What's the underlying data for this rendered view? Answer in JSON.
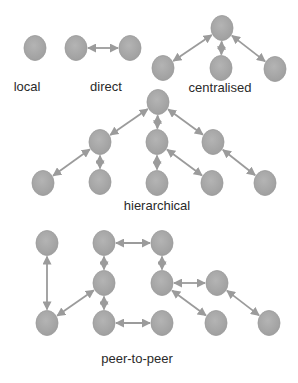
{
  "colors": {
    "node_fill": "#a8a8a8",
    "node_fill_light": "#bdbdbd",
    "node_stroke": "#9a9a9a",
    "edge": "#9b9b9b",
    "label": "#2a2a2a",
    "background": "#ffffff"
  },
  "node_radius": {
    "rx": 11,
    "ry": 12.5
  },
  "groups": [
    {
      "id": "local",
      "label": "local",
      "label_pos": [
        27,
        86
      ],
      "nodes": [
        {
          "id": "l1",
          "x": 35,
          "y": 48
        }
      ],
      "edges": []
    },
    {
      "id": "direct",
      "label": "direct",
      "label_pos": [
        106,
        86
      ],
      "nodes": [
        {
          "id": "d1",
          "x": 76,
          "y": 48
        },
        {
          "id": "d2",
          "x": 130,
          "y": 48
        }
      ],
      "edges": [
        [
          "d1",
          "d2"
        ]
      ]
    },
    {
      "id": "centralised",
      "label": "centralised",
      "label_pos": [
        220,
        87
      ],
      "nodes": [
        {
          "id": "c0",
          "x": 222,
          "y": 28
        },
        {
          "id": "c1",
          "x": 163,
          "y": 68
        },
        {
          "id": "c2",
          "x": 221,
          "y": 68
        },
        {
          "id": "c3",
          "x": 275,
          "y": 69
        }
      ],
      "edges": [
        [
          "c0",
          "c1"
        ],
        [
          "c0",
          "c2"
        ],
        [
          "c0",
          "c3"
        ]
      ]
    },
    {
      "id": "hierarchical",
      "label": "hierarchical",
      "label_pos": [
        157,
        205
      ],
      "nodes": [
        {
          "id": "h0",
          "x": 158,
          "y": 102
        },
        {
          "id": "h1",
          "x": 100,
          "y": 142
        },
        {
          "id": "h2",
          "x": 157,
          "y": 142
        },
        {
          "id": "h3",
          "x": 213,
          "y": 142
        },
        {
          "id": "h4",
          "x": 43,
          "y": 183
        },
        {
          "id": "h5",
          "x": 100,
          "y": 182
        },
        {
          "id": "h6",
          "x": 157,
          "y": 183
        },
        {
          "id": "h7",
          "x": 212,
          "y": 183
        },
        {
          "id": "h8",
          "x": 265,
          "y": 183
        }
      ],
      "edges": [
        [
          "h0",
          "h1"
        ],
        [
          "h0",
          "h2"
        ],
        [
          "h0",
          "h3"
        ],
        [
          "h1",
          "h4"
        ],
        [
          "h1",
          "h5"
        ],
        [
          "h2",
          "h6"
        ],
        [
          "h2",
          "h7"
        ],
        [
          "h3",
          "h8"
        ]
      ]
    },
    {
      "id": "peer-to-peer",
      "label": "peer-to-peer",
      "label_pos": [
        137,
        358
      ],
      "nodes": [
        {
          "id": "p1",
          "x": 47,
          "y": 243
        },
        {
          "id": "p2",
          "x": 104,
          "y": 243
        },
        {
          "id": "p3",
          "x": 162,
          "y": 243
        },
        {
          "id": "p4",
          "x": 104,
          "y": 283
        },
        {
          "id": "p5",
          "x": 162,
          "y": 283
        },
        {
          "id": "p6",
          "x": 217,
          "y": 283
        },
        {
          "id": "p7",
          "x": 47,
          "y": 323
        },
        {
          "id": "p8",
          "x": 104,
          "y": 323
        },
        {
          "id": "p9",
          "x": 162,
          "y": 323
        },
        {
          "id": "p10",
          "x": 216,
          "y": 323
        },
        {
          "id": "p11",
          "x": 269,
          "y": 323
        }
      ],
      "edges": [
        [
          "p1",
          "p7"
        ],
        [
          "p2",
          "p3"
        ],
        [
          "p2",
          "p4"
        ],
        [
          "p4",
          "p7"
        ],
        [
          "p4",
          "p8"
        ],
        [
          "p8",
          "p9"
        ],
        [
          "p3",
          "p5"
        ],
        [
          "p5",
          "p6"
        ],
        [
          "p5",
          "p10"
        ],
        [
          "p6",
          "p11"
        ]
      ]
    }
  ]
}
